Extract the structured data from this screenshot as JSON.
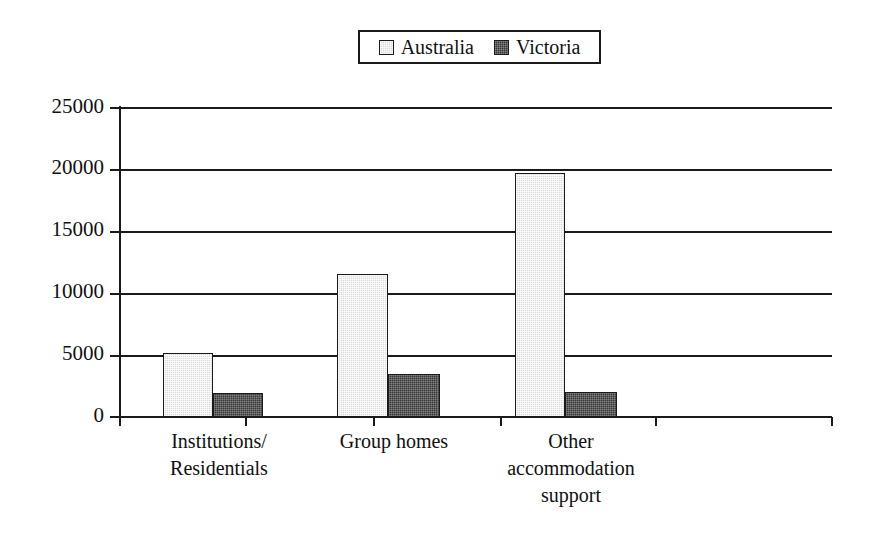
{
  "chart_data": {
    "type": "bar",
    "title": "",
    "xlabel": "",
    "ylabel": "",
    "categories": [
      "Institutions/ Residentials",
      "Group homes",
      "Other accommodation support"
    ],
    "category_lines": [
      [
        "Institutions/",
        "Residentials"
      ],
      [
        "Group homes"
      ],
      [
        "Other",
        "accommodation",
        "support"
      ]
    ],
    "series": [
      {
        "name": "Australia",
        "values": [
          5200,
          11500,
          19700
        ],
        "color": "#dcdcdc"
      },
      {
        "name": "Victoria",
        "values": [
          1900,
          3500,
          2000
        ],
        "color": "#373737"
      }
    ],
    "ylim": [
      0,
      25000
    ],
    "ytick_labels": [
      "25000",
      "20000",
      "15000",
      "10000",
      "5000",
      "0"
    ],
    "ytick_values": [
      25000,
      20000,
      15000,
      10000,
      5000,
      0
    ],
    "grid": true,
    "legend_position": "top-center"
  },
  "legend": {
    "entries": [
      {
        "label": "Australia",
        "swatch": "light-gray-square"
      },
      {
        "label": "Victoria",
        "swatch": "dark-gray-square"
      }
    ]
  },
  "colors": {
    "axis": "#1a1a1a",
    "grid": "#1a1a1a",
    "australia": "#dcdcdc",
    "victoria": "#373737",
    "background": "#ffffff"
  }
}
